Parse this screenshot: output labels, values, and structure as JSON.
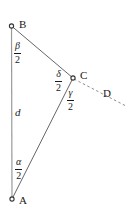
{
  "figure": {
    "type": "geometry-diagram",
    "stroke_color": "#555555",
    "dashed_color": "#8c8c8c",
    "text_color": "#1a1a1a",
    "background": "#ffffff",
    "width": 128,
    "height": 215
  },
  "vertices": [
    {
      "name": "B",
      "label": "B",
      "x": 11,
      "y": 26,
      "marker": "open-circle"
    },
    {
      "name": "C",
      "label": "C",
      "x": 73,
      "y": 78,
      "marker": "open-circle"
    },
    {
      "name": "A",
      "label": "A",
      "x": 12,
      "y": 199,
      "marker": "open-circle"
    }
  ],
  "point_labels": {
    "B": "B",
    "C": "C",
    "A": "A",
    "D": "D"
  },
  "sides": [
    {
      "name": "side-AB",
      "label": "d",
      "from": "A",
      "to": "B"
    },
    {
      "name": "side-BC",
      "label": "",
      "from": "B",
      "to": "C"
    },
    {
      "name": "side-CA",
      "label": "",
      "from": "C",
      "to": "A"
    }
  ],
  "angle_labels": [
    {
      "name": "angle-beta-half",
      "numerator": "β",
      "denominator": "2",
      "at": "B"
    },
    {
      "name": "angle-delta-half",
      "numerator": "δ",
      "denominator": "2",
      "at": "C"
    },
    {
      "name": "angle-gamma-half",
      "numerator": "γ",
      "denominator": "2",
      "at": "C"
    },
    {
      "name": "angle-alpha-half",
      "numerator": "α",
      "denominator": "2",
      "at": "A"
    }
  ],
  "dashed_ray": {
    "name": "ray-CD",
    "from": "C",
    "through": "D",
    "end_label": "D",
    "style": "dashed"
  }
}
